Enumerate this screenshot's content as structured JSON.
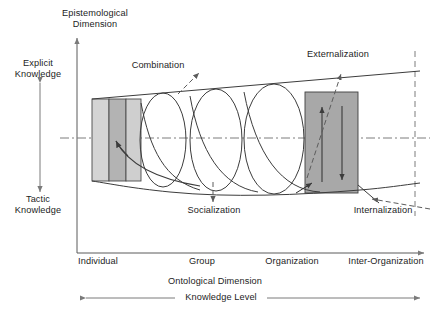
{
  "diagram": {
    "title_axis_y": "Epistemological\nDimension",
    "axis_y_label_line1": "Epistemological",
    "axis_y_label_line2": "Dimension",
    "axis_x_label": "Ontological Dimension",
    "knowledge_level_label": "Knowledge Level",
    "y_scale_top_line1": "Explicit",
    "y_scale_top_line2": "Knowledge",
    "y_scale_bottom_line1": "Tactic",
    "y_scale_bottom_line2": "Knowledge",
    "x_ticks": [
      "Individual",
      "Group",
      "Organization",
      "Inter-Organization"
    ],
    "processes": [
      {
        "name": "Combination",
        "label": "Combination"
      },
      {
        "name": "Externalization",
        "label": "Externalization"
      },
      {
        "name": "Socialization",
        "label": "Socialization"
      },
      {
        "name": "Internalization",
        "label": "Internalization"
      }
    ],
    "colors": {
      "stroke": "#3c3c3c",
      "dashed": "#6e6e6e",
      "block_light": "#d2d2d2",
      "block_mid": "#c0c0c0",
      "block_dark": "#a9a9a9",
      "block_right": "#a8a8a8",
      "text": "#1d1d1d",
      "background": "#ffffff"
    }
  }
}
